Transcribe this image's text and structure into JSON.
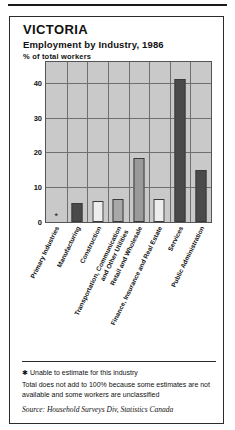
{
  "header": {
    "title": "VICTORIA",
    "subtitle": "Employment by Industry, 1986",
    "unit": "% of total workers"
  },
  "footnotes": {
    "star": "✱ Unable to estimate for this industry",
    "total": "Total does not add to 100% because some estimates are not available and some workers are unclassified",
    "source": "Source: Household Surveys Div, Statistics Canada"
  },
  "chart_data": {
    "type": "bar",
    "title": "Employment by Industry, 1986",
    "xlabel": "",
    "ylabel": "% of total workers",
    "ylim": [
      0,
      46
    ],
    "yticks": [
      0,
      10,
      20,
      30,
      40
    ],
    "grid": true,
    "legend": false,
    "categories": [
      "Primary Industries",
      "Manufacturing",
      "Construction",
      "Transportation, Communication and Other Utilities",
      "Retail and Wholesale",
      "Finance, Insurance and Real Estate",
      "Services",
      "Public Administration"
    ],
    "category_lines": [
      [
        "Primary Industries"
      ],
      [
        "Manufacturing"
      ],
      [
        "Construction"
      ],
      [
        "Transportation, Communication",
        "and Other Utilities"
      ],
      [
        "Retail and Wholesale"
      ],
      [
        "Finance, Insurance and Real Estate"
      ],
      [
        "Services"
      ],
      [
        "Public Administration"
      ]
    ],
    "values": [
      null,
      5.5,
      6.0,
      6.5,
      18.5,
      6.5,
      41.0,
      15.0
    ],
    "value_notes": [
      "*",
      "",
      "",
      "",
      "",
      "",
      "",
      ""
    ],
    "colors": [
      "#c9c9c9",
      "#4a4a4a",
      "#ededed",
      "#a8a8a8",
      "#9a9a9a",
      "#ededed",
      "#4a4a4a",
      "#4a4a4a"
    ],
    "annotations": [
      "✱ Unable to estimate for this industry"
    ]
  },
  "style": {
    "plot_bg": "#c9c9c9",
    "grid_color": "#6f6f6f",
    "frame_color": "#555555",
    "ink": "#111111"
  }
}
